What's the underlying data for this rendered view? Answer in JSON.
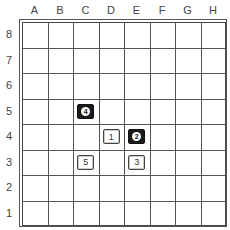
{
  "board": {
    "columns": [
      "A",
      "B",
      "C",
      "D",
      "E",
      "F",
      "G",
      "H"
    ],
    "rows": [
      "8",
      "7",
      "6",
      "5",
      "4",
      "3",
      "2",
      "1"
    ],
    "stones": [
      {
        "square": "D4",
        "color": "white",
        "number": "1"
      },
      {
        "square": "E4",
        "color": "black",
        "number": "2"
      },
      {
        "square": "E3",
        "color": "white",
        "number": "3"
      },
      {
        "square": "C5",
        "color": "black",
        "number": "4"
      },
      {
        "square": "C3",
        "color": "white",
        "number": "5"
      }
    ]
  }
}
